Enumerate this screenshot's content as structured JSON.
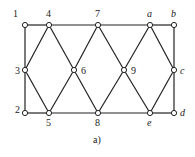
{
  "caption": "a)",
  "nodes": [
    {
      "id": "1",
      "x": 25,
      "y": 25,
      "lx": 13,
      "ly": 17,
      "italic": false
    },
    {
      "id": "4",
      "x": 49,
      "y": 25,
      "lx": 46,
      "ly": 17,
      "italic": false
    },
    {
      "id": "7",
      "x": 98,
      "y": 25,
      "lx": 95,
      "ly": 17,
      "italic": false
    },
    {
      "id": "a",
      "x": 150,
      "y": 25,
      "lx": 147,
      "ly": 17,
      "italic": true
    },
    {
      "id": "b",
      "x": 174,
      "y": 25,
      "lx": 171,
      "ly": 17,
      "italic": true
    },
    {
      "id": "3",
      "x": 25,
      "y": 70,
      "lx": 15,
      "ly": 74,
      "italic": false
    },
    {
      "id": "6",
      "x": 74,
      "y": 70,
      "lx": 81,
      "ly": 74,
      "italic": false
    },
    {
      "id": "9",
      "x": 124,
      "y": 70,
      "lx": 131,
      "ly": 74,
      "italic": false
    },
    {
      "id": "c",
      "x": 174,
      "y": 70,
      "lx": 180,
      "ly": 74,
      "italic": true
    },
    {
      "id": "2",
      "x": 25,
      "y": 113,
      "lx": 15,
      "ly": 113,
      "italic": false
    },
    {
      "id": "5",
      "x": 49,
      "y": 113,
      "lx": 46,
      "ly": 126,
      "italic": false
    },
    {
      "id": "8",
      "x": 98,
      "y": 113,
      "lx": 95,
      "ly": 126,
      "italic": false
    },
    {
      "id": "e",
      "x": 150,
      "y": 113,
      "lx": 147,
      "ly": 126,
      "italic": true
    },
    {
      "id": "d",
      "x": 174,
      "y": 113,
      "lx": 180,
      "ly": 116,
      "italic": true
    }
  ],
  "edges": [
    [
      "1",
      "4"
    ],
    [
      "4",
      "7"
    ],
    [
      "7",
      "a"
    ],
    [
      "a",
      "b"
    ],
    [
      "b",
      "c"
    ],
    [
      "c",
      "d"
    ],
    [
      "d",
      "e"
    ],
    [
      "e",
      "8"
    ],
    [
      "8",
      "5"
    ],
    [
      "5",
      "2"
    ],
    [
      "2",
      "3"
    ],
    [
      "3",
      "1"
    ],
    [
      "4",
      "3"
    ],
    [
      "4",
      "6"
    ],
    [
      "7",
      "6"
    ],
    [
      "7",
      "9"
    ],
    [
      "a",
      "9"
    ],
    [
      "a",
      "c"
    ],
    [
      "3",
      "5"
    ],
    [
      "6",
      "5"
    ],
    [
      "6",
      "8"
    ],
    [
      "9",
      "8"
    ],
    [
      "9",
      "e"
    ],
    [
      "c",
      "e"
    ]
  ]
}
